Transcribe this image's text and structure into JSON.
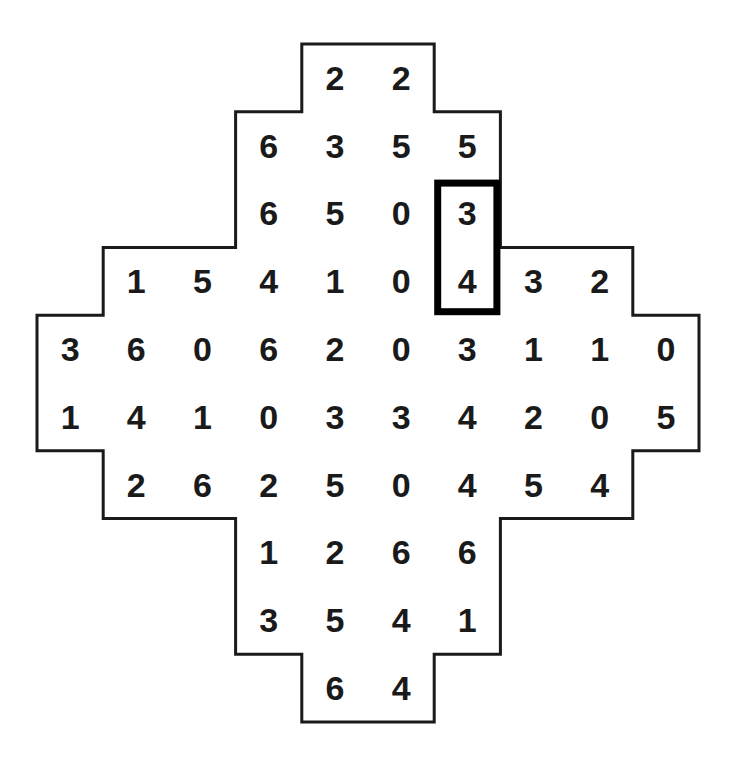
{
  "figure": {
    "type": "number-grid-puzzle",
    "shape": "stepped-cross",
    "columns": 10,
    "rows": 10,
    "background_color": "#ffffff",
    "outline_color": "#1a1a1a",
    "digit_color": "#1a1a1a",
    "highlight_color": "#000000"
  },
  "grid": {
    "rows": [
      {
        "index": 1,
        "start_col": 5,
        "values": [
          "2",
          "2"
        ]
      },
      {
        "index": 2,
        "start_col": 4,
        "values": [
          "6",
          "3",
          "5",
          "5"
        ]
      },
      {
        "index": 3,
        "start_col": 4,
        "values": [
          "6",
          "5",
          "0",
          "3"
        ]
      },
      {
        "index": 4,
        "start_col": 2,
        "values": [
          "1",
          "5",
          "4",
          "1",
          "0",
          "4",
          "3",
          "2"
        ]
      },
      {
        "index": 5,
        "start_col": 1,
        "values": [
          "3",
          "6",
          "0",
          "6",
          "2",
          "0",
          "3",
          "1",
          "1",
          "0"
        ]
      },
      {
        "index": 6,
        "start_col": 1,
        "values": [
          "1",
          "4",
          "1",
          "0",
          "3",
          "3",
          "4",
          "2",
          "0",
          "5"
        ]
      },
      {
        "index": 7,
        "start_col": 2,
        "values": [
          "2",
          "6",
          "2",
          "5",
          "0",
          "4",
          "5",
          "4"
        ]
      },
      {
        "index": 8,
        "start_col": 4,
        "values": [
          "1",
          "2",
          "6",
          "6"
        ]
      },
      {
        "index": 9,
        "start_col": 4,
        "values": [
          "3",
          "5",
          "4",
          "1"
        ]
      },
      {
        "index": 10,
        "start_col": 5,
        "values": [
          "6",
          "4"
        ]
      }
    ]
  },
  "highlight": {
    "label": "selected-domino",
    "column": 7,
    "row_start": 3,
    "row_end": 4,
    "values": [
      "3",
      "4"
    ],
    "orientation": "vertical",
    "border_width_px": 7
  }
}
